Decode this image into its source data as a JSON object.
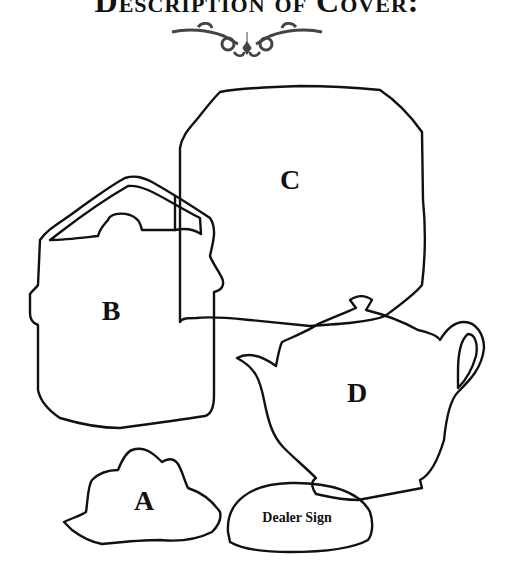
{
  "title": "Description of Cover:",
  "ornament": "decorative-flourish",
  "items": [
    {
      "key": "C",
      "label": "C",
      "shape": "square-plate"
    },
    {
      "key": "B",
      "label": "B",
      "shape": "basket-with-handle"
    },
    {
      "key": "D",
      "label": "D",
      "shape": "teapot"
    },
    {
      "key": "A",
      "label": "A",
      "shape": "flower-cluster"
    },
    {
      "key": "sign",
      "label": "Dealer Sign",
      "shape": "half-dome-sign"
    }
  ],
  "colors": {
    "ink": "#111111",
    "paper": "#ffffff",
    "ornament": "#444444"
  }
}
